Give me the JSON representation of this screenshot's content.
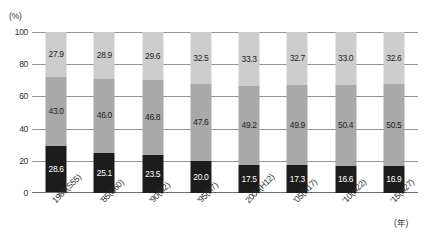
{
  "chart_data": {
    "type": "bar",
    "subtype": "stacked-100",
    "title": "",
    "xlabel": "(年)",
    "ylabel": "(%)",
    "ylim": [
      0,
      100
    ],
    "yticks": [
      0,
      20,
      40,
      60,
      80,
      100
    ],
    "ytick_labels": [
      "0",
      "20",
      "40",
      "60",
      "80",
      "100"
    ],
    "grid": true,
    "legend": "none",
    "categories": [
      "1980(S55)",
      "'85(S60)",
      "'90(H2)",
      "'95(H7)",
      "2000(H12)",
      "'05(H17)",
      "'10(H22)",
      "'15(H27)"
    ],
    "series": [
      {
        "name": "bottom-segment",
        "color": "#1c1c1c",
        "values": [
          28.6,
          25.1,
          23.5,
          20.0,
          17.5,
          17.3,
          16.6,
          16.9
        ],
        "labels": [
          "28.6",
          "25.1",
          "23.5",
          "20.0",
          "17.5",
          "17.3",
          "16.6",
          "16.9"
        ]
      },
      {
        "name": "middle-segment",
        "color": "#a9a9a9",
        "values": [
          43.0,
          46.0,
          46.8,
          47.6,
          49.2,
          49.9,
          50.4,
          50.5
        ],
        "labels": [
          "43.0",
          "46.0",
          "46.8",
          "47.6",
          "49.2",
          "49.9",
          "50.4",
          "50.5"
        ]
      },
      {
        "name": "top-segment",
        "color": "#cdcdcd",
        "values": [
          27.9,
          28.9,
          29.6,
          32.5,
          33.3,
          32.7,
          33.0,
          32.6
        ],
        "labels": [
          "27.9",
          "28.9",
          "29.6",
          "32.5",
          "33.3",
          "32.7",
          "33.0",
          "32.6"
        ]
      }
    ],
    "colors": {
      "bottom": "#1c1c1c",
      "middle": "#a9a9a9",
      "top": "#cdcdcd",
      "gridline": "#949494",
      "text": "#1f1f1f"
    }
  }
}
